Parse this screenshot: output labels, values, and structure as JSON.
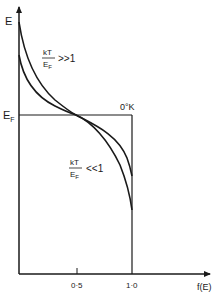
{
  "diagram": {
    "type": "fermi-dirac-distribution",
    "axes": {
      "y_label": "E",
      "x_label": "f(E)",
      "y_tick_label": "E",
      "y_tick_sub": "F",
      "x_ticks": [
        {
          "label": "0·5",
          "value": 0.5
        },
        {
          "label": "1·0",
          "value": 1.0
        }
      ]
    },
    "curves": [
      {
        "name": "high-temperature",
        "annotation_num": "kT",
        "annotation_den": "E",
        "annotation_den_sub": "F",
        "annotation_rel": ">>1"
      },
      {
        "name": "low-temperature",
        "annotation_num": "kT",
        "annotation_den": "E",
        "annotation_den_sub": "F",
        "annotation_rel": "<<1"
      },
      {
        "name": "zero-kelvin-step",
        "annotation": "0°K"
      }
    ],
    "colors": {
      "line": "#1a1a1a",
      "background": "#ffffff"
    }
  }
}
